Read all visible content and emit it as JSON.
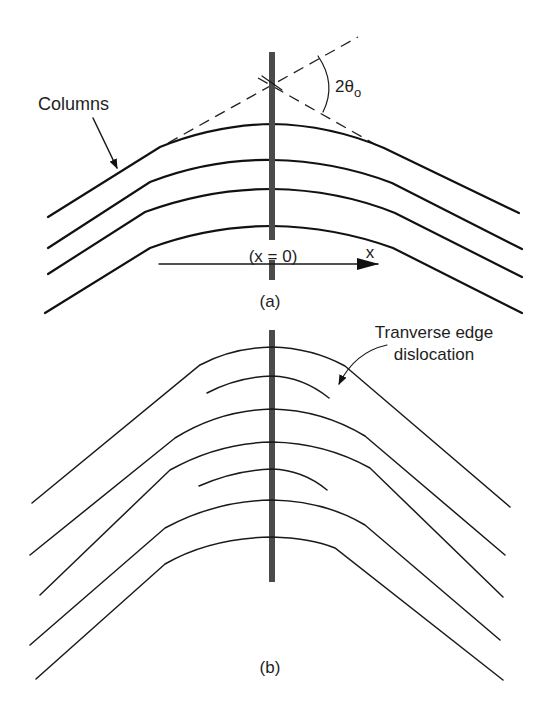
{
  "figure_a": {
    "label": "(a)",
    "columns_label": "Columns",
    "angle_label": "2θ",
    "angle_subscript": "o",
    "origin_label": "(x = 0)",
    "axis_label": "x",
    "column_count": 4
  },
  "figure_b": {
    "label": "(b)",
    "dislocation_label_line1": "Tranverse edge",
    "dislocation_label_line2": "dislocation",
    "full_line_count": 5,
    "partial_line_count": 2
  },
  "colors": {
    "background": "#ffffff",
    "line": "#111111",
    "bar": "#4b4b4b"
  }
}
